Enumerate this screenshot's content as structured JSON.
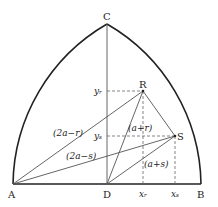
{
  "diagram": {
    "points": {
      "A": {
        "label": "A",
        "x": 13,
        "y": 184
      },
      "D": {
        "label": "D",
        "x": 107,
        "y": 184
      },
      "B": {
        "label": "B",
        "x": 201,
        "y": 184
      },
      "C": {
        "label": "C",
        "x": 107,
        "y": 24
      },
      "R": {
        "label": "R",
        "x": 143,
        "y": 91
      },
      "S": {
        "label": "S",
        "x": 175,
        "y": 136
      }
    },
    "axis_labels": {
      "yr": "yᵣ",
      "ys": "yₛ",
      "xr": "xᵣ",
      "xs": "xₛ"
    },
    "segment_labels": {
      "AR": "(2a−r)",
      "AS": "(2a−s)",
      "DR": "(a+r)",
      "DS": "(a+s)"
    },
    "colors": {
      "arc": "#222222",
      "line": "#555555",
      "dashed": "#666666"
    }
  }
}
